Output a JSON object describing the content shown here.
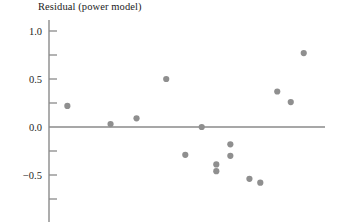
{
  "chart_data": {
    "type": "scatter",
    "title": "Residual (power model)",
    "xlabel": "",
    "ylabel": "",
    "ylim": [
      -0.85,
      1.12
    ],
    "xlim": [
      0,
      1
    ],
    "grid": false,
    "legend": "none",
    "y_ticks_major": [
      1.0,
      0.5,
      0.0,
      -0.5
    ],
    "y_tick_labels": [
      "1.0",
      "0.5",
      "0.0",
      "-0.5"
    ],
    "y_ticks_minor": [
      0.75,
      0.25,
      -0.25,
      -0.75
    ],
    "zero_line": 0.0,
    "point_color": "#8f8f8f",
    "axis_color": "#8a8a8a",
    "point_radius": 3.1,
    "points": [
      {
        "x": 0.058,
        "y": 0.22
      },
      {
        "x": 0.221,
        "y": 0.03
      },
      {
        "x": 0.319,
        "y": 0.09
      },
      {
        "x": 0.431,
        "y": 0.5
      },
      {
        "x": 0.565,
        "y": 0.0
      },
      {
        "x": 0.503,
        "y": -0.29
      },
      {
        "x": 0.62,
        "y": -0.39
      },
      {
        "x": 0.673,
        "y": -0.18
      },
      {
        "x": 0.62,
        "y": -0.46
      },
      {
        "x": 0.745,
        "y": -0.54
      },
      {
        "x": 0.786,
        "y": -0.58
      },
      {
        "x": 0.85,
        "y": 0.37
      },
      {
        "x": 0.901,
        "y": 0.26
      },
      {
        "x": 0.95,
        "y": 0.77
      },
      {
        "x": 0.673,
        "y": -0.3
      }
    ]
  },
  "rendered": {
    "title": "Residual (power model)",
    "y_labels": [
      {
        "text": "1.0",
        "top_px": 31
      },
      {
        "text": "0.5",
        "top_px": 79
      },
      {
        "text": "0.0",
        "top_px": 127
      },
      {
        "text": "−0.5",
        "top_px": 175
      }
    ]
  }
}
